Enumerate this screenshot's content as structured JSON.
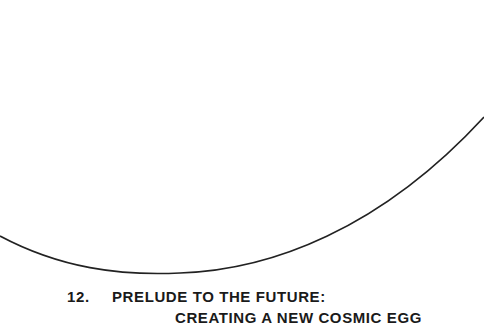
{
  "chapter": {
    "number": "12.",
    "title_line1": "PRELUDE TO THE FUTURE:",
    "title_line2": "CREATING A NEW COSMIC EGG"
  },
  "decoration": {
    "shape": "egg-arc",
    "stroke_color": "#222222"
  }
}
